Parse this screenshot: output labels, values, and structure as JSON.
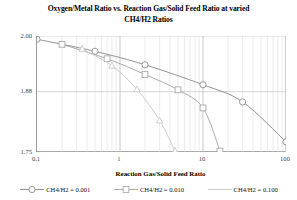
{
  "chart_data": {
    "type": "line",
    "title": "Oxygen/Metal Ratio vs. Reaction Gas/Solid Feed Ratio at varied CH4/H2 Ratios",
    "title_line1": "Oxygen/Metal Ratio vs. Reaction Gas/Solid Feed Ratio at varied",
    "title_line2": "CH4/H2 Ratios",
    "xlabel": "Reaction Gas/Solid Feed Ratio",
    "ylabel": "Oxygen/Metal Ratio",
    "xscale": "log",
    "yscale": "linear",
    "xlim": [
      0.1,
      100
    ],
    "ylim": [
      1.75,
      2.0
    ],
    "xticks": [
      "0.1",
      "1",
      "10",
      "100"
    ],
    "xtick_values": [
      0.1,
      1,
      10,
      100
    ],
    "yticks": [
      "2.00",
      "1.88",
      "1.75"
    ],
    "ytick_values": [
      2.0,
      1.88,
      1.75
    ],
    "grid": "minor-vertical-and-major-horizontal",
    "legend_position": "bottom",
    "series": [
      {
        "name": "CH4/H2 = 0.001",
        "marker": "circle",
        "color": "#8c8c8c",
        "x": [
          0.1,
          0.5,
          2.0,
          10.0,
          30.0,
          100.0
        ],
        "y": [
          1.993,
          1.967,
          1.938,
          1.895,
          1.858,
          1.772
        ]
      },
      {
        "name": "CH4/H2 = 0.010",
        "marker": "square",
        "color": "#a8a8a8",
        "x": [
          0.2,
          0.7,
          2.0,
          5.0,
          10.0,
          16.0
        ],
        "y": [
          1.982,
          1.951,
          1.917,
          1.884,
          1.845,
          1.752
        ]
      },
      {
        "name": "CH4/H2 = 0.100",
        "marker": "triangle",
        "color": "#c9c9c9",
        "x": [
          0.35,
          0.8,
          1.6,
          3.0,
          4.6
        ],
        "y": [
          1.972,
          1.936,
          1.885,
          1.818,
          1.752
        ]
      }
    ]
  },
  "legend": {
    "items": [
      {
        "label": "CH4/H2 = 0.001"
      },
      {
        "label": "CH4/H2 = 0.010"
      },
      {
        "label": "CH4/H2 = 0.100"
      }
    ]
  },
  "axes": {
    "y_ticks": [
      {
        "label": "2.00"
      },
      {
        "label": "1.88"
      },
      {
        "label": "1.75"
      }
    ],
    "x_ticks": [
      {
        "label": "0.1"
      },
      {
        "label": "1"
      },
      {
        "label": "10"
      },
      {
        "label": "100"
      }
    ]
  }
}
